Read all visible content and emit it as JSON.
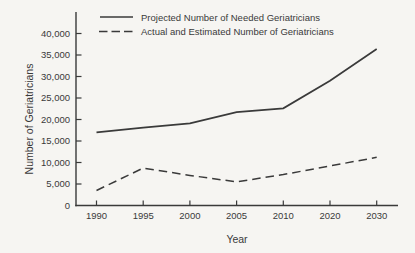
{
  "figure": {
    "background": "#f6f5f2",
    "ink": "#3a3a3a"
  },
  "legend": {
    "items": [
      {
        "label": "Projected Number of Needed Geriatricians",
        "style": "solid"
      },
      {
        "label": "Actual and Estimated Number of Geriatricians",
        "style": "dashed"
      }
    ]
  },
  "chart_data": {
    "type": "line",
    "title": "",
    "xlabel": "Year",
    "ylabel": "Number of Geriatricians",
    "categories": [
      "1990",
      "1995",
      "2000",
      "2005",
      "2010",
      "2020",
      "2030"
    ],
    "y_ticks": [
      "0",
      "5,000",
      "10,000",
      "15,000",
      "20,000",
      "25,000",
      "30,000",
      "35,000",
      "40,000"
    ],
    "ylim": [
      0,
      40000
    ],
    "grid": false,
    "legend_position": "top",
    "series": [
      {
        "name": "Projected Number of Needed Geriatricians",
        "style": "solid",
        "values": [
          17000,
          18100,
          19100,
          21700,
          22600,
          29000,
          36400
        ]
      },
      {
        "name": "Actual and Estimated Number of Geriatricians",
        "style": "dashed",
        "values": [
          3500,
          8700,
          7000,
          5500,
          7200,
          9200,
          11200
        ]
      }
    ]
  }
}
